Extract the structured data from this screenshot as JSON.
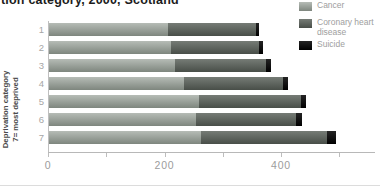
{
  "title": "tion category, 2000, Scotland",
  "y_axis": {
    "label_line1": "Deprivation category",
    "label_line2": "7= most deprived"
  },
  "legend": {
    "items": [
      {
        "label": "Cancer"
      },
      {
        "label": "Coronary heart disease"
      },
      {
        "label": "Suicide"
      }
    ]
  },
  "chart_data": {
    "type": "bar",
    "orientation": "horizontal",
    "stacked": true,
    "title": "tion category, 2000, Scotland",
    "ylabel": "Deprivation category 7= most deprived",
    "xlabel": "",
    "categories": [
      "1",
      "2",
      "3",
      "4",
      "5",
      "6",
      "7"
    ],
    "series": [
      {
        "name": "Cancer",
        "color_top": "#b6bcb6",
        "color_bottom": "#7e867e",
        "values": [
          205,
          210,
          216,
          232,
          258,
          253,
          261
        ]
      },
      {
        "name": "Coronary heart disease",
        "color_top": "#767c76",
        "color_bottom": "#484e48",
        "values": [
          150,
          151,
          156,
          169,
          174,
          171,
          217
        ]
      },
      {
        "name": "Suicide",
        "color_top": "#242424",
        "color_bottom": "#000000",
        "values": [
          6,
          7,
          9,
          9,
          9,
          11,
          14
        ]
      }
    ],
    "xlim": [
      0,
      560
    ],
    "x_ticks_labeled": [
      0,
      200,
      400
    ],
    "x_ticks_minor": [
      100,
      300,
      500
    ],
    "grid": false,
    "legend_position": "top-right"
  }
}
